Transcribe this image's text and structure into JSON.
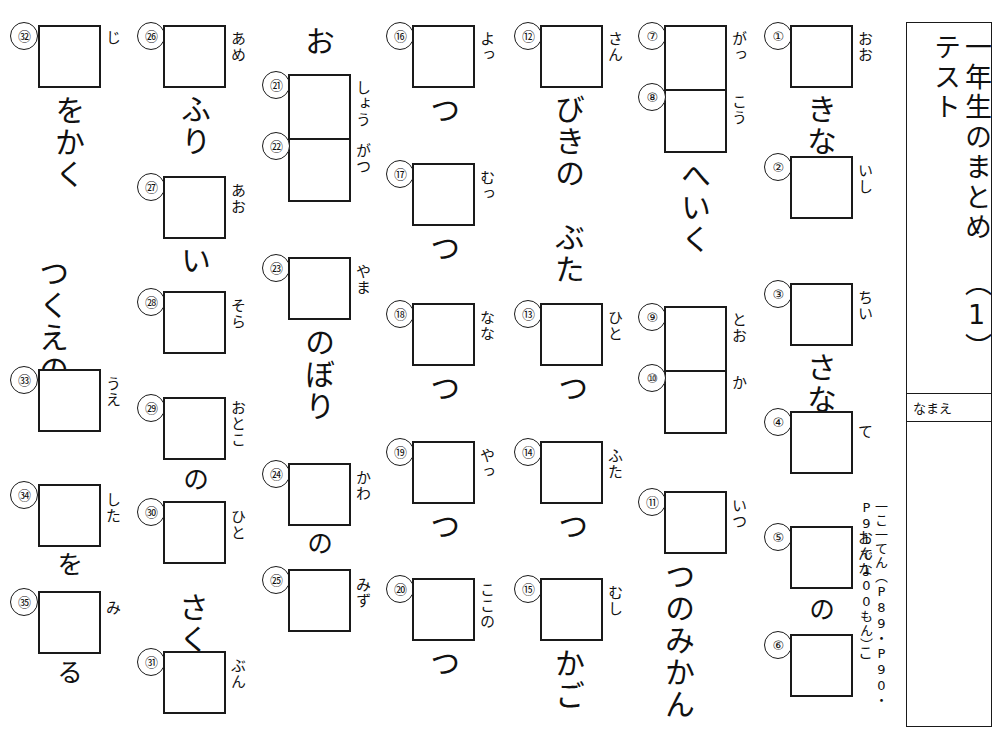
{
  "worksheet": {
    "title": "一年生のまとめテスト",
    "title_number": "（1）",
    "name_label": "なまえ",
    "score_note": "一こ一てん（P89・P90・P91で100もん）"
  },
  "columns": [
    {
      "id": "col-1",
      "groups": [
        {
          "id": "g1",
          "items": [
            {
              "num": "①",
              "furigana": "おお"
            },
            {
              "okurigana": "きな"
            },
            {
              "num": "②",
              "furigana": "いし"
            }
          ]
        },
        {
          "id": "g2",
          "items": [
            {
              "num": "③",
              "furigana": "ちい"
            },
            {
              "okurigana": "さな"
            },
            {
              "num": "④",
              "furigana": "て"
            }
          ]
        },
        {
          "id": "g3",
          "items": [
            {
              "num": "⑤",
              "furigana": "おんな"
            },
            {
              "okurigana": "の"
            },
            {
              "num": "⑥",
              "furigana": "こ"
            }
          ]
        }
      ]
    },
    {
      "id": "col-2",
      "groups": [
        {
          "id": "g4",
          "items": [
            {
              "num": "⑦",
              "furigana": "がっ"
            },
            {
              "num": "⑧",
              "furigana": "こう"
            },
            {
              "okurigana": "へいく"
            }
          ]
        },
        {
          "id": "g5",
          "items": [
            {
              "num": "⑨",
              "furigana": "とお"
            },
            {
              "num": "⑩",
              "furigana": "か"
            }
          ]
        },
        {
          "id": "g6",
          "items": [
            {
              "num": "⑪",
              "furigana": "いつ"
            },
            {
              "okurigana": "つのみかん"
            }
          ]
        }
      ]
    },
    {
      "id": "col-3",
      "groups": [
        {
          "id": "g7",
          "items": [
            {
              "num": "⑫",
              "furigana": "さん"
            },
            {
              "okurigana": "びきの　ぶた"
            }
          ]
        },
        {
          "id": "g8",
          "items": [
            {
              "num": "⑬",
              "furigana": "ひと"
            },
            {
              "okurigana": "つ"
            }
          ]
        },
        {
          "id": "g9",
          "items": [
            {
              "num": "⑭",
              "furigana": "ふた"
            },
            {
              "okurigana": "つ"
            }
          ]
        },
        {
          "id": "g10",
          "items": [
            {
              "num": "⑮",
              "furigana": "むし"
            },
            {
              "okurigana": "かご"
            }
          ]
        }
      ]
    },
    {
      "id": "col-4",
      "groups": [
        {
          "id": "g11",
          "items": [
            {
              "num": "⑯",
              "furigana": "よっ"
            },
            {
              "okurigana": "つ"
            }
          ]
        },
        {
          "id": "g12",
          "items": [
            {
              "num": "⑰",
              "furigana": "むっ"
            },
            {
              "okurigana": "つ"
            }
          ]
        },
        {
          "id": "g13",
          "items": [
            {
              "num": "⑱",
              "furigana": "なな"
            },
            {
              "okurigana": "つ"
            }
          ]
        },
        {
          "id": "g14",
          "items": [
            {
              "num": "⑲",
              "furigana": "やっ"
            },
            {
              "okurigana": "つ"
            }
          ]
        },
        {
          "id": "g15",
          "items": [
            {
              "num": "⑳",
              "furigana": "ここの"
            },
            {
              "okurigana": "つ"
            }
          ]
        }
      ]
    },
    {
      "id": "col-5",
      "groups": [
        {
          "id": "g16",
          "items": [
            {
              "okurigana": "お"
            },
            {
              "num": "㉑",
              "furigana": "しょう"
            },
            {
              "num": "㉒",
              "furigana": "がつ"
            }
          ]
        },
        {
          "id": "g17",
          "items": [
            {
              "num": "㉓",
              "furigana": "やま"
            },
            {
              "okurigana": "のぼり"
            }
          ]
        },
        {
          "id": "g18",
          "items": [
            {
              "num": "㉔",
              "furigana": "かわ"
            },
            {
              "okurigana": "の"
            },
            {
              "num": "㉕",
              "furigana": "みず"
            }
          ]
        }
      ]
    },
    {
      "id": "col-6",
      "groups": [
        {
          "id": "g19",
          "items": [
            {
              "num": "㉖",
              "furigana": "あめ"
            },
            {
              "okurigana": "ふり"
            }
          ]
        },
        {
          "id": "g20",
          "items": [
            {
              "num": "㉗",
              "furigana": "あお"
            },
            {
              "okurigana": "い"
            }
          ]
        },
        {
          "id": "g21",
          "items": [
            {
              "num": "㉘",
              "furigana": "そら"
            }
          ]
        },
        {
          "id": "g22",
          "items": [
            {
              "num": "㉙",
              "furigana": "おとこ"
            },
            {
              "okurigana": "の"
            },
            {
              "num": "㉚",
              "furigana": "ひと"
            }
          ]
        },
        {
          "id": "g23",
          "items": [
            {
              "okurigana": "さく"
            },
            {
              "num": "㉛",
              "furigana": "ぶん"
            }
          ]
        }
      ]
    },
    {
      "id": "col-7",
      "groups": [
        {
          "id": "g24",
          "items": [
            {
              "num": "㉜",
              "furigana": "じ"
            },
            {
              "okurigana": "をかく"
            }
          ]
        },
        {
          "id": "g25",
          "items": [
            {
              "okurigana": "つくえの"
            },
            {
              "num": "㉝",
              "furigana": "うえ"
            }
          ]
        },
        {
          "id": "g26",
          "items": [
            {
              "num": "㉞",
              "furigana": "した"
            },
            {
              "okurigana": "を"
            },
            {
              "num": "㉟",
              "furigana": "み"
            },
            {
              "okurigana": "る"
            }
          ]
        }
      ]
    }
  ],
  "labels": {
    "n1": "①",
    "n2": "②",
    "n3": "③",
    "n4": "④",
    "n5": "⑤",
    "n6": "⑥",
    "n7": "⑦",
    "n8": "⑧",
    "n9": "⑨",
    "n10": "⑩",
    "n11": "⑪",
    "n12": "⑫",
    "n13": "⑬",
    "n14": "⑭",
    "n15": "⑮",
    "n16": "⑯",
    "n17": "⑰",
    "n18": "⑱",
    "n19": "⑲",
    "n20": "⑳",
    "n21": "㉑",
    "n22": "㉒",
    "n23": "㉓",
    "n24": "㉔",
    "n25": "㉕",
    "n26": "㉖",
    "n27": "㉗",
    "n28": "㉘",
    "n29": "㉙",
    "n30": "㉚",
    "n31": "㉛",
    "n32": "㉜",
    "n33": "㉝",
    "n34": "㉞",
    "n35": "㉟"
  },
  "furigana": {
    "f1": "おお",
    "f2": "いし",
    "f3": "ちい",
    "f4": "て",
    "f5": "おんな",
    "f6": "こ",
    "f7": "がっ",
    "f8": "こう",
    "f9": "とお",
    "f10": "か",
    "f11": "いつ",
    "f12": "さん",
    "f13": "ひと",
    "f14": "ふた",
    "f15": "むし",
    "f16": "よっ",
    "f17": "むっ",
    "f18": "なな",
    "f19": "やっ",
    "f20": "ここの",
    "f21": "しょう",
    "f22": "がつ",
    "f23": "やま",
    "f24": "かわ",
    "f25": "みず",
    "f26": "あめ",
    "f27": "あお",
    "f28": "そら",
    "f29": "おとこ",
    "f30": "ひと",
    "f31": "ぶん",
    "f32": "じ",
    "f33": "うえ",
    "f34": "した",
    "f35": "み"
  },
  "okurigana": {
    "k1": "きな",
    "k3": "さな",
    "k5": "の",
    "k7": "へいく",
    "k11": "つのみかん",
    "k12": "びきの　ぶた",
    "k13": "つ",
    "k14": "つ",
    "k15": "かご",
    "k16": "つ",
    "k17": "つ",
    "k18": "つ",
    "k19": "つ",
    "k20": "つ",
    "k21": "お",
    "k23": "のぼり",
    "k24": "の",
    "k26": "ふり",
    "k27": "い",
    "k29": "の",
    "k30": "さく",
    "k32": "をかく",
    "k33": "つくえの",
    "k34": "を",
    "k35": "る"
  }
}
